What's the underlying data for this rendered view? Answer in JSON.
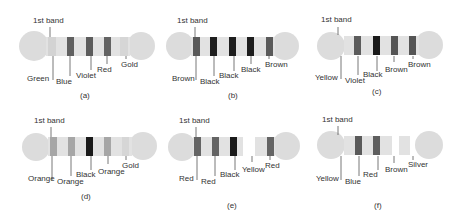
{
  "colors": {
    "body": "#e2e2e2",
    "end_cap": "#dcdcdc",
    "band_light": "#d2d2d2",
    "band_mid": "#6e6e6e",
    "band_dark": "#3a3a3a",
    "band_black": "#1a1a1a",
    "band_brown": "#5a5a5a",
    "band_orange": "#9a9a9a",
    "band_gold": "#d6d6d6",
    "leader": "#555555",
    "text": "#333333"
  },
  "first_band_label": "1st band",
  "resistors": [
    {
      "caption": "(a)",
      "ox": 0,
      "oy": 0,
      "bands": [
        {
          "name": "Green",
          "x": 48,
          "w": 0,
          "fill": "none"
        },
        {
          "name": "Blue",
          "x": 67,
          "w": 7,
          "fill": "#606060"
        },
        {
          "name": "Violet",
          "x": 86,
          "w": 7,
          "fill": "#5c5c5c"
        },
        {
          "name": "Red",
          "x": 104,
          "w": 7,
          "fill": "#636363"
        },
        {
          "name": "Gold",
          "x": 125,
          "w": 0,
          "fill": "none"
        }
      ],
      "labels": [
        {
          "text": "Green",
          "x": 27,
          "y": 80,
          "lx": 52,
          "ly1": 56,
          "ly2": 78
        },
        {
          "text": "Blue",
          "x": 56,
          "y": 83,
          "lx": 70,
          "ly1": 56,
          "ly2": 76
        },
        {
          "text": "Violet",
          "x": 76,
          "y": 76,
          "lx": 91,
          "ly1": 56,
          "ly2": 70
        },
        {
          "text": "Red",
          "x": 97,
          "y": 71,
          "lx": 107,
          "ly1": 56,
          "ly2": 64
        },
        {
          "text": "Gold",
          "x": 122,
          "y": 66,
          "lx": 126,
          "ly1": 56,
          "ly2": 59
        }
      ],
      "first_band_x": 50
    },
    {
      "caption": "(b)",
      "ox": 155,
      "oy": 0,
      "bands": [
        {
          "name": "Brown",
          "x": 38,
          "w": 7,
          "fill": "#5a5a5a"
        },
        {
          "name": "Black",
          "x": 55,
          "w": 7,
          "fill": "#1e1e1e"
        },
        {
          "name": "Black",
          "x": 74,
          "w": 7,
          "fill": "#1e1e1e"
        },
        {
          "name": "Black",
          "x": 92,
          "w": 7,
          "fill": "#1e1e1e"
        },
        {
          "name": "Brown",
          "x": 111,
          "w": 7,
          "fill": "#5a5a5a"
        }
      ],
      "labels": [
        {
          "text": "Brown",
          "x": 17,
          "y": 80,
          "lx": 41,
          "ly1": 56,
          "ly2": 80
        },
        {
          "text": "Black",
          "x": 45,
          "y": 83,
          "lx": 59,
          "ly1": 56,
          "ly2": 74
        },
        {
          "text": "Black",
          "x": 64,
          "y": 77,
          "lx": 79,
          "ly1": 56,
          "ly2": 72
        },
        {
          "text": "Black",
          "x": 86,
          "y": 71,
          "lx": 96,
          "ly1": 56,
          "ly2": 63
        },
        {
          "text": "Brown",
          "x": 110,
          "y": 66,
          "lx": 114,
          "ly1": 56,
          "ly2": 59
        }
      ],
      "first_band_x": 40
    },
    {
      "caption": "(c)",
      "ox": 306,
      "oy": 0,
      "gap": true,
      "bands": [
        {
          "name": "Yellow",
          "x": 33,
          "w": 0,
          "fill": "none"
        },
        {
          "name": "Violet",
          "x": 49,
          "w": 7,
          "fill": "#5c5c5c"
        },
        {
          "name": "Black",
          "x": 68,
          "w": 7,
          "fill": "#1a1a1a"
        },
        {
          "name": "Brown",
          "x": 85,
          "w": 7,
          "fill": "#555555"
        },
        {
          "name": "Brown",
          "x": 103,
          "w": 7,
          "fill": "#555555"
        }
      ],
      "labels": [
        {
          "text": "Yellow",
          "x": 9,
          "y": 80,
          "lx": 35,
          "ly1": 56,
          "ly2": 80
        },
        {
          "text": "Violet",
          "x": 40,
          "y": 83,
          "lx": 53,
          "ly1": 56,
          "ly2": 74
        },
        {
          "text": "Black",
          "x": 58,
          "y": 77,
          "lx": 72,
          "ly1": 56,
          "ly2": 72
        },
        {
          "text": "Brown",
          "x": 79,
          "y": 72,
          "lx": 89,
          "ly1": 56,
          "ly2": 63
        },
        {
          "text": "Brown",
          "x": 102,
          "y": 66,
          "lx": 107,
          "ly1": 56,
          "ly2": 59
        }
      ],
      "first_band_x": 32
    },
    {
      "caption": "(d)",
      "ox": 0,
      "oy": 108,
      "bands": [
        {
          "name": "Orange",
          "x": 50,
          "w": 7,
          "fill": "#a6a6a6"
        },
        {
          "name": "Orange",
          "x": 68,
          "w": 7,
          "fill": "#a6a6a6"
        },
        {
          "name": "Black",
          "x": 86,
          "w": 7,
          "fill": "#1a1a1a"
        },
        {
          "name": "Orange",
          "x": 104,
          "w": 7,
          "fill": "#a6a6a6"
        },
        {
          "name": "Gold",
          "x": 125,
          "w": 0,
          "fill": "none"
        }
      ],
      "labels": [
        {
          "text": "Orange",
          "x": 28,
          "y": 73,
          "lx": 52,
          "ly1": 48,
          "ly2": 72
        },
        {
          "text": "Orange",
          "x": 57,
          "y": 75,
          "lx": 71,
          "ly1": 48,
          "ly2": 68
        },
        {
          "text": "Black",
          "x": 76,
          "y": 68,
          "lx": 91,
          "ly1": 48,
          "ly2": 62
        },
        {
          "text": "Orange",
          "x": 98,
          "y": 65,
          "lx": 108,
          "ly1": 48,
          "ly2": 56
        },
        {
          "text": "Gold",
          "x": 122,
          "y": 59,
          "lx": 126,
          "ly1": 48,
          "ly2": 52
        }
      ],
      "first_band_x": 51
    },
    {
      "caption": "(e)",
      "ox": 155,
      "oy": 108,
      "gap": true,
      "bands": [
        {
          "name": "Red",
          "x": 39,
          "w": 7,
          "fill": "#646464"
        },
        {
          "name": "Red",
          "x": 57,
          "w": 7,
          "fill": "#646464"
        },
        {
          "name": "Black",
          "x": 75,
          "w": 7,
          "fill": "#1a1a1a"
        },
        {
          "name": "Yellow",
          "x": 97,
          "w": 0,
          "fill": "none"
        },
        {
          "name": "Red",
          "x": 112,
          "w": 7,
          "fill": "#646464"
        }
      ],
      "labels": [
        {
          "text": "Red",
          "x": 24,
          "y": 73,
          "lx": 42,
          "ly1": 48,
          "ly2": 72
        },
        {
          "text": "Red",
          "x": 47,
          "y": 75,
          "lx": 60,
          "ly1": 48,
          "ly2": 68
        },
        {
          "text": "Black",
          "x": 65,
          "y": 68,
          "lx": 80,
          "ly1": 48,
          "ly2": 62
        },
        {
          "text": "Yellow",
          "x": 88,
          "y": 64,
          "lx": 97,
          "ly1": 48,
          "ly2": 53
        },
        {
          "text": "Red",
          "x": 111,
          "y": 59,
          "lx": 115,
          "ly1": 48,
          "ly2": 52
        }
      ],
      "first_band_x": 41
    },
    {
      "caption": "(f)",
      "ox": 306,
      "oy": 108,
      "gap": true,
      "bands": [
        {
          "name": "Yellow",
          "x": 33,
          "w": 0,
          "fill": "none"
        },
        {
          "name": "Blue",
          "x": 49,
          "w": 7,
          "fill": "#5a5a5a"
        },
        {
          "name": "Red",
          "x": 67,
          "w": 7,
          "fill": "#5e5e5e"
        },
        {
          "name": "Brown",
          "x": 86,
          "w": 0,
          "fill": "none"
        },
        {
          "name": "Silver",
          "x": 106,
          "w": 0,
          "fill": "none"
        }
      ],
      "labels": [
        {
          "text": "Yellow",
          "x": 10,
          "y": 73,
          "lx": 35,
          "ly1": 48,
          "ly2": 72
        },
        {
          "text": "Blue",
          "x": 39,
          "y": 75,
          "lx": 52,
          "ly1": 48,
          "ly2": 68
        },
        {
          "text": "Red",
          "x": 57,
          "y": 69,
          "lx": 71,
          "ly1": 48,
          "ly2": 62
        },
        {
          "text": "Brown",
          "x": 79,
          "y": 64,
          "lx": 88,
          "ly1": 48,
          "ly2": 56
        },
        {
          "text": "Silver",
          "x": 102,
          "y": 59,
          "lx": 107,
          "ly1": 48,
          "ly2": 52
        }
      ],
      "first_band_x": 32
    }
  ]
}
